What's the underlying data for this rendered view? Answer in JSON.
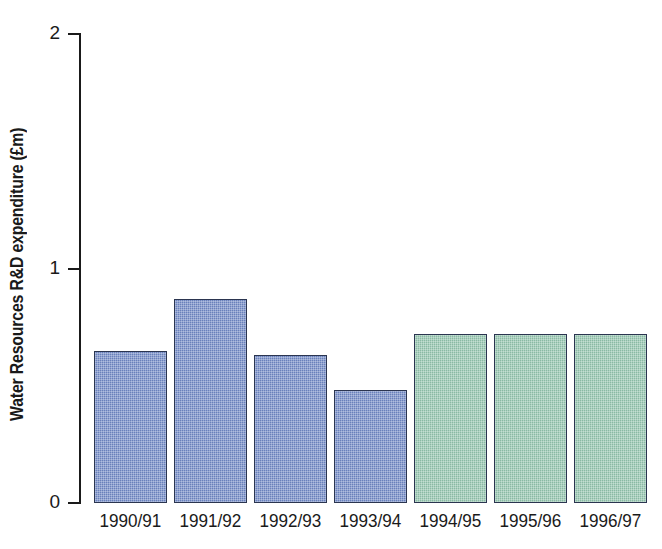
{
  "chart_data": {
    "type": "bar",
    "title": "",
    "subtitle": "",
    "xlabel": "",
    "ylabel": "Water Resources R&D expenditure (£m)",
    "categories": [
      "1990/91",
      "1991/92",
      "1992/93",
      "1993/94",
      "1994/95",
      "1995/96",
      "1996/97"
    ],
    "values": [
      0.65,
      0.87,
      0.63,
      0.48,
      0.72,
      0.72,
      0.72
    ],
    "ylim": [
      0,
      2
    ],
    "ytick_labels": [
      "0",
      "1",
      "2"
    ],
    "ytick_values": [
      0,
      1,
      2
    ],
    "grid": false,
    "legend": null,
    "annotations": [],
    "series": [
      {
        "name": "Water Resources R&D expenditure",
        "values": [
          0.65,
          0.87,
          0.63,
          0.48,
          0.72,
          0.72,
          0.72
        ]
      }
    ],
    "bar_colors": [
      "#7189c6",
      "#7189c6",
      "#7189c6",
      "#7189c6",
      "#93c5ae",
      "#93c5ae",
      "#93c5ae"
    ],
    "bar_groups": [
      {
        "name": "actual",
        "color": "#7189c6",
        "categories": [
          "1990/91",
          "1991/92",
          "1992/93",
          "1993/94"
        ]
      },
      {
        "name": "planned",
        "color": "#93c5ae",
        "categories": [
          "1994/95",
          "1995/96",
          "1996/97"
        ]
      }
    ]
  },
  "colors": {
    "background": "#ffffff",
    "axis": "#1a1a1a",
    "text": "#1a1a1a",
    "bar_blue": "#7189c6",
    "bar_green": "#93c5ae",
    "bar_border": "#2b3550"
  },
  "axis": {
    "y_title": "Water Resources R&D expenditure (£m)",
    "ticks": [
      {
        "label": "2",
        "value": 2
      },
      {
        "label": "1",
        "value": 1
      },
      {
        "label": "0",
        "value": 0
      }
    ]
  },
  "bars": [
    {
      "label": "1990/91",
      "value": 0.65,
      "color": "#7189c6"
    },
    {
      "label": "1991/92",
      "value": 0.87,
      "color": "#7189c6"
    },
    {
      "label": "1992/93",
      "value": 0.63,
      "color": "#7189c6"
    },
    {
      "label": "1993/94",
      "value": 0.48,
      "color": "#7189c6"
    },
    {
      "label": "1994/95",
      "value": 0.72,
      "color": "#93c5ae"
    },
    {
      "label": "1995/96",
      "value": 0.72,
      "color": "#93c5ae"
    },
    {
      "label": "1996/97",
      "value": 0.72,
      "color": "#93c5ae"
    }
  ]
}
